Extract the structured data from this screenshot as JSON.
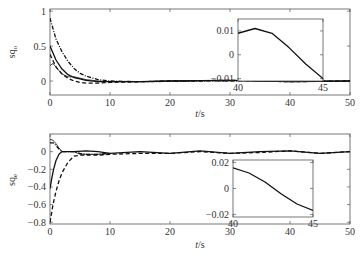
{
  "chart_data": [
    {
      "type": "line",
      "title": "",
      "ylabel": "sq_o",
      "ylabel_main": "sq",
      "ylabel_sub": "o",
      "xlabel": "t/s",
      "xlim": [
        0,
        50
      ],
      "ylim": [
        -0.2,
        1.03
      ],
      "xticks": [
        "0",
        "10",
        "20",
        "30",
        "40",
        "50"
      ],
      "yticks": [
        "0",
        "0.5",
        "1"
      ],
      "grid": false,
      "series": [
        {
          "name": "curve-1",
          "style": "dash-dot",
          "x": [
            0,
            1,
            2,
            3,
            4,
            5,
            6,
            8,
            10,
            15,
            20,
            30,
            40,
            50
          ],
          "y": [
            0.9,
            0.6,
            0.42,
            0.28,
            0.18,
            0.11,
            0.07,
            0.02,
            0.0,
            -0.01,
            -0.005,
            0.005,
            -0.005,
            0.0
          ]
        },
        {
          "name": "curve-2",
          "style": "solid",
          "x": [
            0,
            1,
            2,
            3,
            4,
            5,
            6,
            8,
            10,
            15,
            20,
            30,
            40,
            50
          ],
          "y": [
            0.5,
            0.3,
            0.17,
            0.09,
            0.05,
            0.03,
            0.01,
            -0.01,
            -0.01,
            -0.01,
            0.0,
            0.01,
            -0.01,
            0.0
          ]
        },
        {
          "name": "curve-3",
          "style": "dashed",
          "x": [
            0,
            1,
            2,
            3,
            4,
            5,
            6,
            8,
            10,
            15,
            20,
            30,
            40,
            50
          ],
          "y": [
            0.38,
            0.2,
            0.1,
            0.04,
            0.0,
            -0.02,
            -0.03,
            -0.03,
            -0.02,
            -0.01,
            0.0,
            0.01,
            -0.01,
            0.0
          ]
        },
        {
          "name": "curve-4",
          "style": "solid-thin",
          "x": [
            0,
            0.5,
            1,
            2,
            3,
            4,
            5,
            6,
            8,
            10,
            15,
            20,
            30,
            40,
            50
          ],
          "y": [
            0.22,
            0.25,
            0.2,
            0.1,
            0.06,
            0.06,
            0.04,
            0.02,
            0.0,
            -0.01,
            -0.01,
            0.0,
            0.01,
            -0.01,
            0.0
          ]
        }
      ],
      "inset": {
        "xlim": [
          40,
          45
        ],
        "ylim": [
          -0.011,
          0.015
        ],
        "xticks": [
          "40",
          "45"
        ],
        "yticks": [
          "-0.01",
          "0",
          "0.01"
        ],
        "series": [
          {
            "name": "zoom",
            "style": "solid",
            "x": [
              40,
              41,
              42,
              43,
              44,
              45
            ],
            "y": [
              0.009,
              0.011,
              0.009,
              0.003,
              -0.004,
              -0.01
            ]
          }
        ]
      }
    },
    {
      "type": "line",
      "title": "",
      "ylabel": "sq_e",
      "ylabel_main": "sq",
      "ylabel_sub": "e",
      "xlabel": "t/s",
      "xlim": [
        0,
        50
      ],
      "ylim": [
        -0.82,
        0.2
      ],
      "xticks": [
        "0",
        "10",
        "20",
        "30",
        "40",
        "50"
      ],
      "yticks": [
        "-0.8",
        "-0.6",
        "-0.4",
        "-0.2",
        "0"
      ],
      "grid": false,
      "series": [
        {
          "name": "curve-1",
          "style": "dashed",
          "x": [
            0,
            0.5,
            1,
            1.5,
            2,
            3,
            4,
            5,
            6,
            8,
            10,
            15,
            20,
            25,
            30,
            35,
            40,
            45,
            50
          ],
          "y": [
            -0.8,
            -0.6,
            -0.45,
            -0.33,
            -0.24,
            -0.12,
            -0.05,
            -0.04,
            -0.04,
            -0.04,
            -0.03,
            -0.02,
            -0.02,
            0.0,
            -0.02,
            -0.01,
            0.01,
            -0.02,
            0.0
          ]
        },
        {
          "name": "curve-2",
          "style": "solid",
          "x": [
            0,
            0.3,
            0.6,
            1,
            1.5,
            2,
            3,
            4,
            6,
            8,
            10,
            15,
            20,
            25,
            30,
            35,
            40,
            45,
            50
          ],
          "y": [
            -0.42,
            -0.3,
            -0.2,
            -0.1,
            -0.03,
            0.0,
            0.0,
            0.0,
            0.01,
            0.0,
            -0.02,
            0.0,
            -0.02,
            0.01,
            -0.02,
            0.0,
            0.01,
            -0.02,
            0.0
          ]
        },
        {
          "name": "curve-3",
          "style": "solid-thin",
          "x": [
            0,
            0.5,
            1,
            1.5,
            2,
            3,
            4,
            5,
            6,
            8,
            10
          ],
          "y": [
            0.14,
            0.13,
            0.09,
            0.04,
            0.0,
            0.0,
            0.0,
            -0.03,
            -0.03,
            -0.03,
            -0.02
          ]
        },
        {
          "name": "curve-4",
          "style": "dash-dot",
          "x": [
            0,
            0.5,
            1,
            1.5,
            2,
            3,
            4,
            5,
            6,
            8,
            10
          ],
          "y": [
            0.1,
            0.1,
            0.07,
            0.03,
            0.0,
            0.0,
            0.0,
            -0.02,
            -0.03,
            -0.03,
            -0.02
          ]
        }
      ],
      "inset": {
        "xlim": [
          40,
          45
        ],
        "ylim": [
          -0.022,
          0.022
        ],
        "xticks": [
          "40",
          "45"
        ],
        "yticks": [
          "-0.02",
          "0",
          "0.02"
        ],
        "series": [
          {
            "name": "zoom",
            "style": "solid",
            "x": [
              40,
              41,
              42,
              43,
              44,
              45
            ],
            "y": [
              0.016,
              0.012,
              0.005,
              -0.004,
              -0.012,
              -0.017
            ]
          }
        ]
      }
    }
  ]
}
